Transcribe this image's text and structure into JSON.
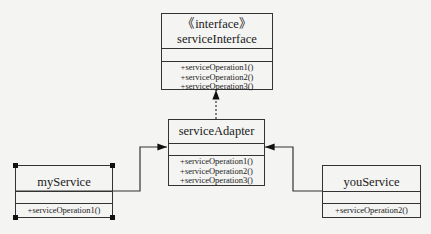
{
  "diagram": {
    "type": "uml-class-diagram",
    "pattern": "adapter",
    "classes": {
      "interface": {
        "stereotype": "《interface》",
        "name": "serviceInterface",
        "operations": [
          "+serviceOperation1()",
          "+serviceOperation2()",
          "+serviceOperation3()"
        ]
      },
      "adapter": {
        "name": "serviceAdapter",
        "operations": [
          "+serviceOperation1()",
          "+serviceOperation2()",
          "+serviceOperation3()"
        ]
      },
      "my_service": {
        "name": "myService",
        "operations": [
          "+serviceOperation1()"
        ]
      },
      "you_service": {
        "name": "youService",
        "operations": [
          "+serviceOperation2()"
        ]
      }
    },
    "relations": [
      {
        "from": "serviceAdapter",
        "to": "serviceInterface",
        "kind": "realization",
        "style": "dashed"
      },
      {
        "from": "myService",
        "to": "serviceAdapter",
        "kind": "association",
        "style": "solid"
      },
      {
        "from": "youService",
        "to": "serviceAdapter",
        "kind": "association",
        "style": "solid"
      }
    ],
    "colors": {
      "line": "#333333",
      "background": "#f4f4f2"
    }
  }
}
